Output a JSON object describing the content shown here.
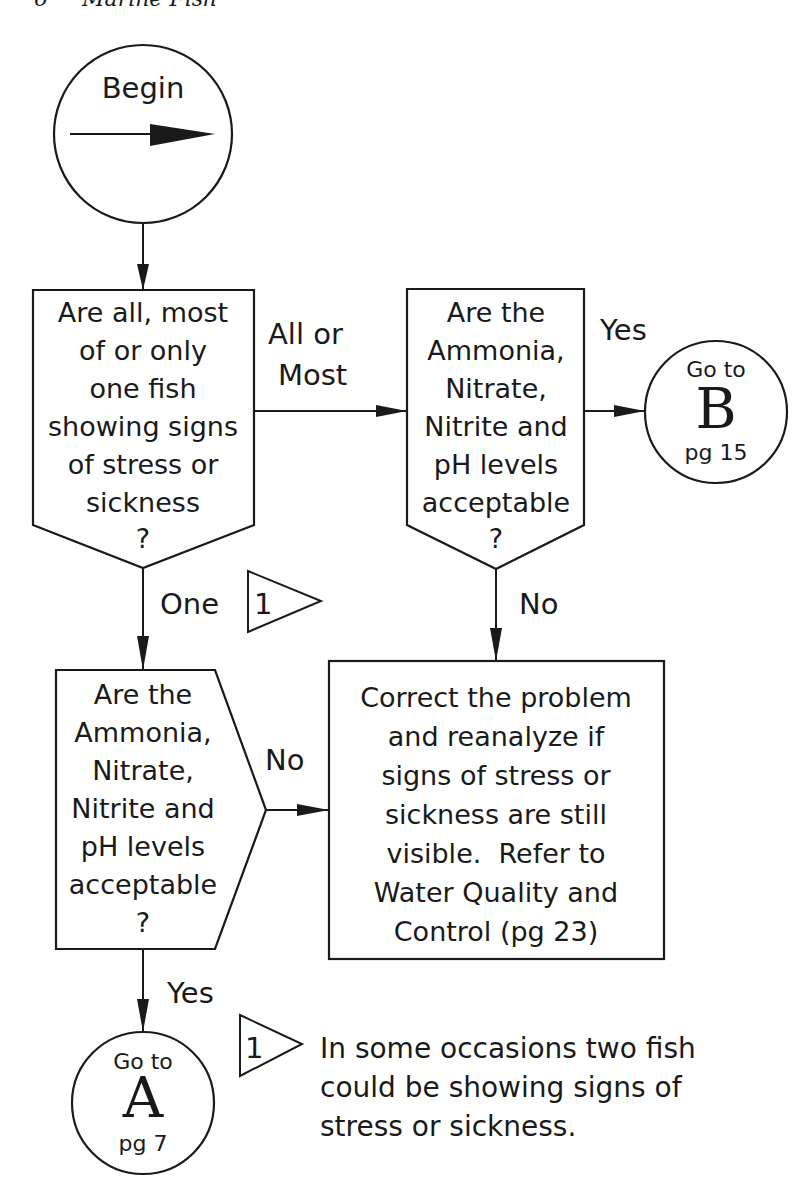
{
  "header": {
    "page_number": "6",
    "title": "Marine Fish"
  },
  "flowchart": {
    "begin": {
      "label": "Begin"
    },
    "decision_all_or_one": {
      "lines": [
        "Are all, most",
        "of or only",
        "one fish",
        "showing signs",
        "of stress or",
        "sickness",
        "?"
      ]
    },
    "decision_water_top": {
      "lines": [
        "Are the",
        "Ammonia,",
        "Nitrate,",
        "Nitrite and",
        "pH levels",
        "acceptable",
        "?"
      ]
    },
    "decision_water_bottom": {
      "lines": [
        "Are the",
        "Ammonia,",
        "Nitrate,",
        "Nitrite and",
        "pH levels",
        "acceptable",
        "?"
      ]
    },
    "process_correct": {
      "lines": [
        "Correct the problem",
        "and reanalyze if",
        "signs of stress or",
        "sickness are still",
        "visible.  Refer to",
        "Water Quality and",
        "Control (pg 23)"
      ]
    },
    "connector_b": {
      "goto": "Go to",
      "letter": "B",
      "page": "pg 15"
    },
    "connector_a": {
      "goto": "Go to",
      "letter": "A",
      "page": "pg 7"
    },
    "edge_labels": {
      "all_or_most_line1": "All or",
      "all_or_most_line2": "Most",
      "yes_top": "Yes",
      "one": "One",
      "no_top": "No",
      "no_bottom": "No",
      "yes_bottom": "Yes"
    },
    "note_flag": {
      "number": "1"
    }
  },
  "footnote": {
    "number": "1",
    "lines": [
      "In some occasions two fish",
      "could be showing signs of",
      "stress or sickness."
    ]
  }
}
